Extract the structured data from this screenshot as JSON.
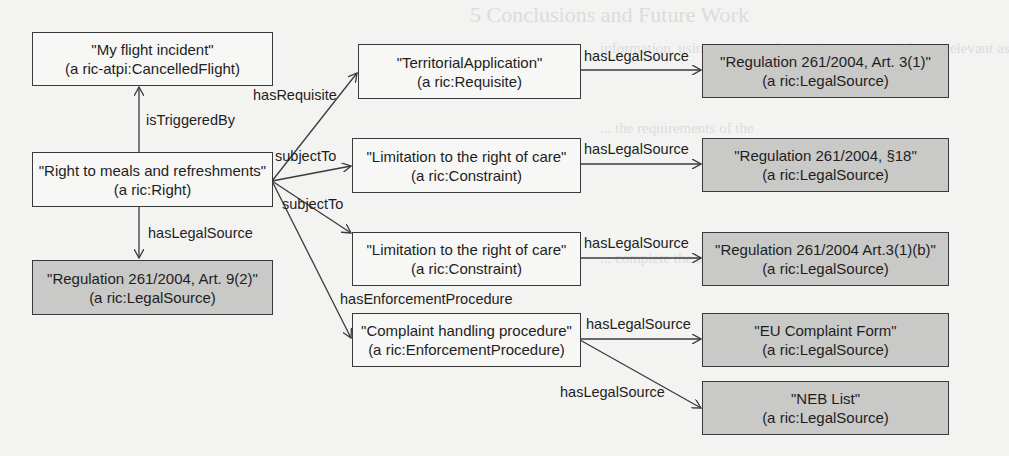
{
  "background_text": {
    "heading": "5  Conclusions and Future Work",
    "lines": [
      "information, using a case study on air passenger rights ... relevant as",
      "... the requirements of the",
      "... complete the ontology ... of the"
    ]
  },
  "nodes": {
    "flight_incident": {
      "title": "\"My flight incident\"",
      "type": "(a ric-atpi:CancelledFlight)"
    },
    "right_meals": {
      "title": "\"Right to meals and refreshments\"",
      "type": "(a ric:Right)"
    },
    "reg_art9": {
      "title": "\"Regulation 261/2004, Art. 9(2)\"",
      "type": "(a ric:LegalSource)"
    },
    "territorial": {
      "title": "\"TerritorialApplication\"",
      "type": "(a ric:Requisite)"
    },
    "limitation1": {
      "title": "\"Limitation to the right of care\"",
      "type": "(a ric:Constraint)"
    },
    "limitation2": {
      "title": "\"Limitation to the right of care\"",
      "type": "(a ric:Constraint)"
    },
    "complaint": {
      "title": "\"Complaint handling procedure\"",
      "type": "(a ric:EnforcementProcedure)"
    },
    "reg_art3_1": {
      "title": "\"Regulation 261/2004, Art. 3(1)\"",
      "type": "(a ric:LegalSource)"
    },
    "reg_18": {
      "title": "\"Regulation 261/2004, §18\"",
      "type": "(a ric:LegalSource)"
    },
    "reg_art3_1b": {
      "title": "\"Regulation 261/2004 Art.3(1)(b)\"",
      "type": "(a ric:LegalSource)"
    },
    "eu_form": {
      "title": "\"EU Complaint Form\"",
      "type": "(a ric:LegalSource)"
    },
    "neb_list": {
      "title": "\"NEB List\"",
      "type": "(a ric:LegalSource)"
    }
  },
  "edges": {
    "is_triggered_by": "isTriggeredBy",
    "has_legal_source_art9": "hasLegalSource",
    "has_requisite": "hasRequisite",
    "subject_to_1": "subjectTo",
    "subject_to_2": "subjectTo",
    "has_enforcement_procedure": "hasEnforcementProcedure",
    "territorial_legal_source": "hasLegalSource",
    "limitation1_legal_source": "hasLegalSource",
    "limitation2_legal_source": "hasLegalSource",
    "complaint_legal_source_form": "hasLegalSource",
    "complaint_legal_source_neb": "hasLegalSource"
  },
  "colors": {
    "plain_node_fill": "#f7f7f6",
    "legal_node_fill": "#c9c9c8",
    "stroke": "#3a3a3a",
    "page": "#f3f3f2"
  }
}
